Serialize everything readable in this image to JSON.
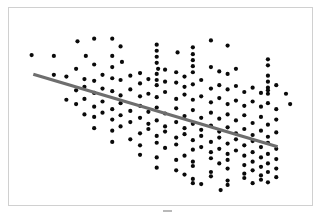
{
  "figure": {
    "title": "",
    "background_color": "#ffffff",
    "frame_color": "#d0d0d0",
    "caption_artifact": ""
  },
  "chart_data": {
    "type": "scatter",
    "title": "",
    "subtitle": "",
    "xlabel": "",
    "ylabel": "",
    "xlim": [
      0,
      100
    ],
    "ylim": [
      0,
      100
    ],
    "grid": false,
    "legend": null,
    "marker": {
      "shape": "circle",
      "color": "#0a0a0a",
      "size_px": 4.2
    },
    "trendline": {
      "label": "",
      "color": "#6e6e6e",
      "width_px": 3.2,
      "x_start": 4.6,
      "y_start": 69.3,
      "x_end": 92.5,
      "y_end": 27.2
    },
    "annotations": [],
    "x": [
      4.0,
      20.5,
      23.5,
      33.0,
      12.0,
      26.5,
      33.0,
      36.0,
      49.0,
      49.0,
      49.0,
      49.0,
      49.5,
      56.5,
      68.5,
      74.5,
      62.0,
      62.0,
      62.0,
      62.0,
      89.0,
      89.0,
      89.0,
      20.0,
      26.5,
      33.0,
      36.5,
      43.0,
      49.0,
      49.0,
      52.0,
      56.0,
      59.0,
      62.0,
      68.5,
      71.5,
      74.5,
      77.5,
      89.0,
      89.0,
      89.0,
      92.0,
      12.0,
      16.5,
      23.0,
      26.5,
      29.5,
      33.0,
      36.0,
      39.5,
      43.0,
      46.0,
      49.0,
      52.0,
      56.0,
      59.0,
      62.0,
      65.0,
      68.5,
      71.5,
      74.5,
      77.5,
      80.5,
      83.5,
      86.5,
      89.0,
      95.5,
      20.0,
      23.0,
      26.5,
      29.5,
      33.0,
      36.0,
      39.5,
      43.0,
      46.0,
      49.0,
      52.0,
      56.0,
      59.0,
      62.0,
      65.0,
      68.5,
      71.5,
      74.5,
      77.5,
      80.5,
      83.5,
      86.5,
      89.0,
      92.0,
      97.0,
      16.5,
      20.0,
      23.0,
      26.5,
      29.5,
      33.0,
      36.0,
      39.5,
      43.0,
      46.0,
      49.0,
      52.0,
      56.0,
      59.0,
      62.0,
      65.0,
      68.5,
      71.5,
      74.5,
      77.5,
      80.5,
      83.5,
      86.5,
      89.0,
      92.0,
      23.0,
      26.5,
      29.5,
      33.0,
      36.0,
      39.5,
      43.0,
      46.0,
      49.0,
      52.0,
      56.0,
      59.0,
      62.0,
      65.0,
      68.5,
      71.5,
      74.5,
      77.5,
      80.5,
      83.5,
      86.5,
      89.0,
      92.0,
      26.5,
      33.0,
      36.0,
      43.0,
      46.0,
      49.0,
      52.0,
      56.0,
      59.0,
      62.0,
      65.0,
      68.5,
      71.5,
      74.5,
      77.5,
      80.5,
      83.5,
      86.5,
      89.0,
      92.0,
      33.0,
      39.5,
      43.0,
      49.0,
      52.0,
      56.0,
      62.0,
      65.0,
      68.5,
      71.5,
      74.5,
      77.5,
      80.5,
      83.5,
      86.5,
      89.0,
      92.0,
      43.0,
      49.0,
      56.0,
      59.0,
      62.0,
      68.5,
      71.5,
      74.5,
      80.5,
      83.5,
      86.5,
      89.0,
      92.0,
      49.0,
      56.0,
      62.0,
      68.5,
      74.5,
      80.5,
      83.5,
      86.5,
      89.0,
      92.0,
      59.0,
      62.0,
      68.5,
      74.5,
      80.5,
      86.5,
      89.0,
      62.0,
      65.0,
      74.5,
      83.5,
      72.0
    ],
    "y": [
      80.5,
      88.5,
      80.0,
      80.0,
      80.0,
      90.0,
      90.0,
      85.5,
      86.5,
      83.0,
      79.5,
      76.0,
      72.5,
      82.0,
      89.0,
      86.0,
      85.0,
      81.0,
      77.5,
      74.0,
      78.0,
      74.5,
      68.5,
      72.5,
      75.0,
      73.5,
      76.5,
      70.0,
      69.5,
      66.0,
      72.0,
      70.5,
      68.0,
      70.5,
      73.5,
      71.0,
      69.5,
      72.5,
      65.0,
      61.5,
      58.0,
      63.0,
      69.0,
      68.0,
      66.5,
      65.5,
      69.0,
      67.0,
      66.0,
      68.5,
      64.0,
      66.5,
      63.0,
      65.0,
      64.5,
      62.0,
      63.5,
      66.0,
      61.0,
      63.0,
      60.5,
      62.5,
      59.0,
      61.5,
      58.5,
      60.0,
      58.0,
      60.0,
      62.0,
      58.5,
      61.0,
      59.5,
      57.0,
      60.5,
      56.5,
      58.0,
      56.0,
      59.0,
      55.0,
      57.5,
      54.5,
      56.5,
      53.0,
      55.5,
      52.0,
      54.0,
      51.0,
      53.5,
      50.5,
      52.5,
      49.0,
      52.0,
      54.5,
      52.0,
      55.0,
      50.5,
      53.5,
      49.0,
      52.5,
      48.0,
      51.0,
      47.5,
      50.0,
      46.5,
      49.5,
      45.0,
      48.5,
      44.0,
      47.0,
      43.5,
      46.0,
      42.5,
      45.5,
      41.0,
      44.5,
      40.0,
      43.0,
      46.0,
      44.5,
      47.0,
      43.0,
      45.5,
      41.5,
      44.0,
      40.5,
      42.5,
      39.0,
      41.5,
      38.0,
      40.5,
      37.0,
      39.5,
      36.0,
      38.5,
      35.0,
      37.5,
      34.0,
      36.5,
      33.0,
      35.5,
      38.0,
      36.5,
      39.0,
      35.0,
      37.5,
      33.5,
      36.0,
      32.5,
      34.5,
      31.0,
      33.5,
      30.0,
      32.5,
      29.0,
      31.5,
      28.0,
      30.5,
      27.0,
      29.5,
      26.0,
      30.0,
      31.5,
      28.0,
      29.5,
      26.5,
      28.5,
      25.5,
      27.0,
      24.0,
      26.0,
      23.0,
      25.0,
      22.0,
      24.0,
      21.0,
      23.0,
      20.0,
      22.5,
      21.0,
      19.5,
      22.0,
      18.5,
      20.5,
      17.5,
      19.5,
      16.5,
      18.5,
      15.5,
      17.5,
      14.5,
      15.0,
      13.5,
      16.0,
      12.5,
      14.5,
      11.5,
      13.5,
      10.5,
      12.5,
      9.5,
      11.0,
      8.5,
      10.0,
      7.5,
      9.0,
      8.0,
      6.5,
      6.0,
      5.5,
      5.0,
      6.0,
      2.0
    ]
  }
}
